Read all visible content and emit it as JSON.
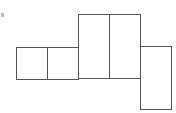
{
  "diagram": {
    "stroke_color": "#555555",
    "background": "#ffffff",
    "faces": [
      {
        "id": "small-left",
        "x": 16,
        "y": 47,
        "w": 31,
        "h": 32
      },
      {
        "id": "small-right",
        "x": 47,
        "y": 47,
        "w": 31,
        "h": 32
      },
      {
        "id": "tall-left",
        "x": 78,
        "y": 14,
        "w": 31,
        "h": 64
      },
      {
        "id": "tall-right",
        "x": 109,
        "y": 14,
        "w": 31,
        "h": 64
      },
      {
        "id": "bottom-right",
        "x": 140,
        "y": 46,
        "w": 31,
        "h": 63
      }
    ],
    "marks": [
      {
        "id": "top-left-dot",
        "x": 1,
        "y": 13,
        "w": 3,
        "h": 4
      }
    ]
  }
}
